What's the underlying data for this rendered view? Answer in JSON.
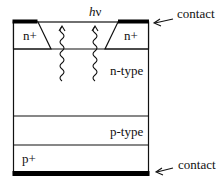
{
  "diagram": {
    "type": "semiconductor-cross-section",
    "layers": [
      {
        "id": "n-plus-left",
        "label": "n+"
      },
      {
        "id": "n-plus-right",
        "label": "n+"
      },
      {
        "id": "n-type",
        "label": "n-type"
      },
      {
        "id": "p-type",
        "label": "p-type"
      },
      {
        "id": "p-plus",
        "label": "p+"
      }
    ],
    "photon_label_h": "h",
    "photon_label_nu": "ν",
    "contact_top_label": "contact",
    "contact_bottom_label": "contact"
  },
  "colors": {
    "line": "#111111",
    "contact": "#000000",
    "background": "#ffffff"
  }
}
